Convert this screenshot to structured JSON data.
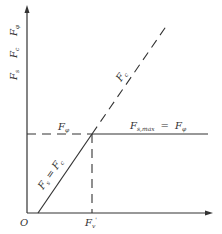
{
  "diagram": {
    "colors": {
      "line": "#333333",
      "text": "#333333",
      "background": "#ffffff"
    },
    "axes": {
      "origin_label": "O",
      "y_axis_label": {
        "parts": [
          {
            "main": "F",
            "sub": "s"
          },
          {
            "main": "F",
            "sub": "c"
          },
          {
            "main": "F",
            "sub": "φ"
          }
        ]
      },
      "x_tick_label": {
        "main": "F",
        "sub": "v",
        "prime": "'"
      }
    },
    "lines": {
      "dashed_diagonal": {
        "label_main": "F",
        "label_sub": "c"
      },
      "solid_diagonal": {
        "label": "F_s = F_c",
        "left_main": "F",
        "left_sub": "s",
        "eq": "=",
        "right_main": "F",
        "right_sub": "c"
      },
      "horizontal_dashed": {
        "label_main": "F",
        "label_sub": "φ"
      },
      "horizontal_solid": {
        "label_left_main": "F",
        "label_left_sub": "s,max",
        "eq": "=",
        "label_right_main": "F",
        "label_right_sub": "φ"
      }
    }
  }
}
